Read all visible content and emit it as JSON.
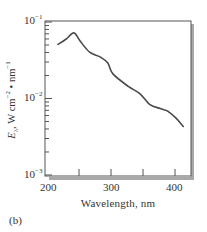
{
  "chart_data": {
    "type": "line",
    "title": "",
    "panel_label": "(b)",
    "xlabel": "Wavelength, nm",
    "ylabel": "E_λ, W cm^-2 • nm^-1",
    "yscale": "log",
    "xlim": [
      197,
      425
    ],
    "ylim": [
      0.001,
      0.1
    ],
    "x_ticks": [
      200,
      300,
      400
    ],
    "x_minor_ticks": [
      250,
      350
    ],
    "y_ticks": [
      {
        "value": 0.1,
        "base": "10",
        "exp": "−1"
      },
      {
        "value": 0.01,
        "base": "10",
        "exp": "−2"
      },
      {
        "value": 0.001,
        "base": "10",
        "exp": "−3"
      }
    ],
    "grid": false,
    "legend": null,
    "series": [
      {
        "name": "E_λ",
        "color": "#4a4a4a",
        "x": [
          217,
          230,
          242,
          252,
          267,
          283,
          295,
          303,
          327,
          345,
          361,
          377,
          389,
          402,
          413
        ],
        "y": [
          0.051,
          0.06,
          0.072,
          0.056,
          0.04,
          0.035,
          0.029,
          0.021,
          0.0144,
          0.0116,
          0.0083,
          0.0074,
          0.0068,
          0.0055,
          0.0043
        ]
      }
    ]
  },
  "labels": {
    "xlabel": "Wavelength, nm",
    "ylabel_main": "E",
    "ylabel_sub": "λ",
    "ylabel_rest1": ", W cm",
    "ylabel_exp1": "−2",
    "ylabel_rest2": " • nm",
    "ylabel_exp2": "−1",
    "panel": "(b)",
    "x200": "200",
    "x300": "300",
    "x400": "400",
    "ybase": "10",
    "yexp1": "−1",
    "yexp2": "−2",
    "yexp3": "−3"
  },
  "colors": {
    "frame": "#555555",
    "shadow": "#9a9a9a",
    "line": "#4a4a4a"
  }
}
